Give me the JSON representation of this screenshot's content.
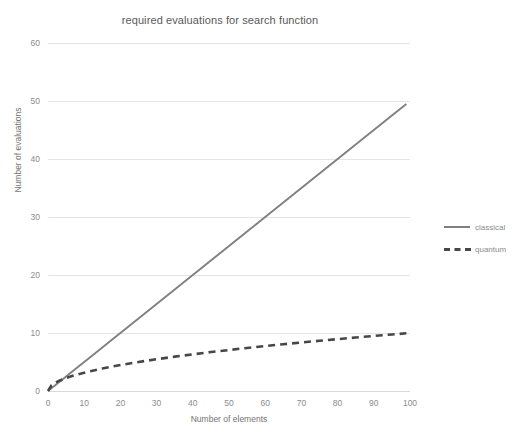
{
  "chart_data": {
    "type": "line",
    "title": "required evaluations for search function",
    "xlabel": "Number of elements",
    "ylabel": "Number of evaluations",
    "xlim": [
      0,
      100
    ],
    "ylim": [
      0,
      60
    ],
    "xticks": [
      0,
      10,
      20,
      30,
      40,
      50,
      60,
      70,
      80,
      90,
      100
    ],
    "yticks": [
      0,
      10,
      20,
      30,
      40,
      50,
      60
    ],
    "grid": "horizontal",
    "legend_position": "right",
    "x": [
      0,
      1,
      2,
      3,
      4,
      5,
      6,
      8,
      10,
      12,
      15,
      18,
      20,
      25,
      30,
      35,
      40,
      45,
      50,
      55,
      60,
      65,
      70,
      75,
      80,
      85,
      90,
      95,
      99
    ],
    "series": [
      {
        "name": "classical",
        "style": "solid",
        "color": "#808080",
        "values": [
          0,
          0.5,
          1,
          1.5,
          2,
          2.5,
          3,
          4,
          5,
          6,
          7.5,
          9,
          10,
          12.5,
          15,
          17.5,
          20,
          22.5,
          25,
          27.5,
          30,
          32.5,
          35,
          37.5,
          40,
          42.5,
          45,
          47.5,
          49.5
        ]
      },
      {
        "name": "quantum",
        "style": "dashed",
        "color": "#474747",
        "values": [
          0,
          1,
          1.41,
          1.73,
          2,
          2.24,
          2.45,
          2.83,
          3.16,
          3.46,
          3.87,
          4.24,
          4.47,
          5,
          5.48,
          5.92,
          6.32,
          6.71,
          7.07,
          7.42,
          7.75,
          8.06,
          8.37,
          8.66,
          8.94,
          9.22,
          9.49,
          9.75,
          9.95
        ]
      }
    ]
  },
  "legend": {
    "entries": [
      {
        "label": "classical"
      },
      {
        "label": "quantum"
      }
    ]
  },
  "colors": {
    "classical": "#808080",
    "quantum": "#474747",
    "grid": "#e4e4e4",
    "text": "#8c8c8c",
    "title": "#595959"
  }
}
